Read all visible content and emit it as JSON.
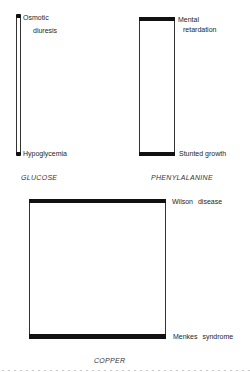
{
  "diagram": {
    "panels": [
      {
        "name": "glucose",
        "caption": "GLUCOSE",
        "top_label_line1": "Osmotic",
        "top_label_line2": "diuresis",
        "bottom_label": "Hypoglycemia",
        "relative_range": "narrow"
      },
      {
        "name": "phenylalanine",
        "caption": "PHENYLALANINE",
        "top_label_line1": "Mental",
        "top_label_line2": "retardation",
        "bottom_label": "Stunted growth",
        "relative_range": "medium"
      },
      {
        "name": "copper",
        "caption": "COPPER",
        "top_label_line1": "Wilson disease",
        "bottom_label": "Menkes syndrome",
        "relative_range": "wide"
      }
    ],
    "colors": {
      "bar": "#111111",
      "outline": "#333333",
      "background": "#ffffff"
    }
  }
}
